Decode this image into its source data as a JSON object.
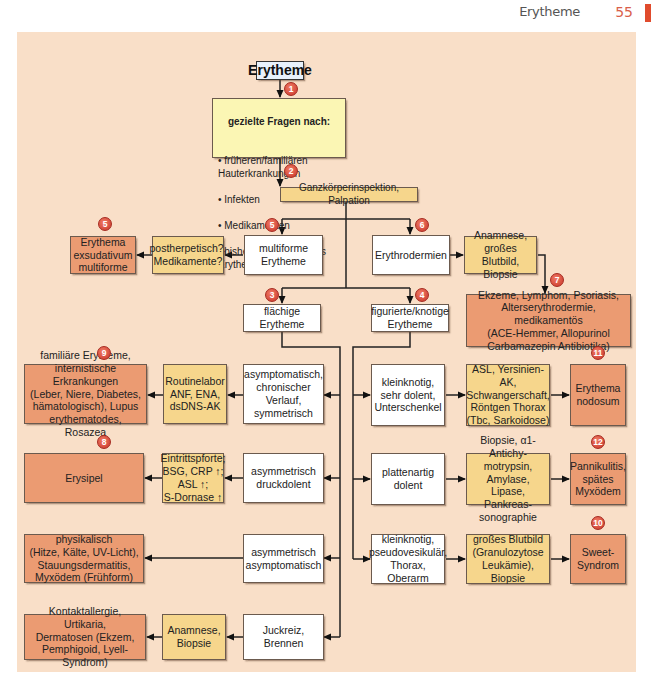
{
  "header": {
    "title": "Erytheme",
    "page_number": "55"
  },
  "diagram": {
    "root": "Erytheme",
    "questions": {
      "heading": "gezielte Fragen nach:",
      "items": [
        "früheren/familiären Hauterkrankungen",
        "Infekten",
        "Medikamenten",
        "bisherigem Verlauf des Erythems"
      ]
    },
    "inspection": "Ganzkörperinspektion, Palpation",
    "badges": [
      "1",
      "2",
      "3",
      "4",
      "5",
      "5",
      "6",
      "7",
      "8",
      "9",
      "10",
      "11",
      "12"
    ],
    "nodes": {
      "multiforme": "multiforme\nErytheme",
      "postherpetisch": "postherpetisch?,\nMedikamente?",
      "eem": "Erythema\nexsudativum\nmultiforme",
      "erythrodermien": "Erythrodermien",
      "anamnese_blutbild": "Anamnese,\ngroßes Blutbild,\nBiopsie",
      "ekzeme": "Ekzeme, Lymphom, Psoriasis,\nAlterserythrodermie, medikamentös\n(ACE-Hemmer, Allopurinol\nCarbamazepin Antibiotika)",
      "flaechige": "flächige\nErytheme",
      "figurierte": "figurierte/knotige\nErytheme",
      "asymptomatisch_chronisch": "asymptomatisch,\nchronischer\nVerlauf,\nsymmetrisch",
      "routinelabor": "Routinelabor\nANF, ENA,\ndsDNS-AK",
      "familiaere": "familiäre Erytheme,\ninternistische Erkrankungen\n(Leber, Niere, Diabetes,\nhämatologisch), Lupus\nerythematodes, Rosazea",
      "asym_druckdolent": "asymmetrisch\ndruckdolent",
      "eintrittspforte": "Eintrittspforte;\nBSG, CRP ↑;\nASL ↑;\nS-Dornase ↑",
      "erysipel": "Erysipel",
      "asym_asymptomatisch": "asymmetrisch\nasymptomatisch",
      "physikalisch": "physikalisch\n(Hitze, Kälte, UV-Licht),\nStauungsdermatitis,\nMyxödem (Frühform)",
      "juckreiz": "Juckreiz,\nBrennen",
      "anamnese_biopsie": "Anamnese,\nBiopsie",
      "kontaktallergie": "Kontaktallergie, Urtikaria,\nDermatosen (Ekzem,\nPemphigoid, Lyell-Syndrom)",
      "kleinknotig_dolent": "kleinknotig,\nsehr dolent,\nUnterschenkel",
      "asl_yersinien": "ASL, Yersinien-AK,\nSchwangerschaft,\nRöntgen Thorax\n(Tbc, Sarkoidose)",
      "erythema_nodosum": "Erythema\nnodosum",
      "plattenartig": "plattenartig\ndolent",
      "biopsie_antichymo": "Biopsie, α1-Antichy-\nmotrypsin, Amylase,\nLipase, Pankreas-\nsonographie",
      "pannikulitis": "Pannikulitis,\nspätes\nMyxödem",
      "kleinknotig_pseudo": "kleinknotig,\npseudovesikulär,\nThorax, Oberarm",
      "grosses_blutbild": "großes Blutbild\n(Granulozytose\nLeukämie), Biopsie",
      "sweet": "Sweet-\nSyndrom"
    }
  },
  "colors": {
    "background": "#f9dfc8",
    "white_box": "#ffffff",
    "yellow_box": "#f6d68c",
    "question_box": "#fbf6b4",
    "orange_box": "#eb9b72",
    "badge": "#d9473a",
    "page_accent": "#e04b2d"
  }
}
